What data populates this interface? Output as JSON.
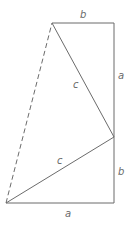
{
  "diagram": {
    "type": "geometric-figure",
    "line_color": "#6b6b6b",
    "vertices": {
      "top_left": [
        52,
        23
      ],
      "top_right": [
        114,
        23
      ],
      "right_mid": [
        114,
        137
      ],
      "bottom_right": [
        114,
        203
      ],
      "bottom_left": [
        6,
        203
      ]
    },
    "labels": {
      "top": "b",
      "right_upper": "a",
      "hyp_upper": "c",
      "hyp_lower": "c",
      "right_lower": "b",
      "bottom": "a"
    }
  }
}
